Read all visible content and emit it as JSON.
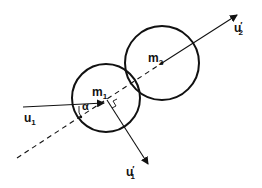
{
  "diagram": {
    "type": "elastic collision of two spheres",
    "bodies": [
      {
        "id": "m1",
        "label": "m",
        "subscript": "1",
        "center": [
          106,
          98
        ],
        "radius": 34
      },
      {
        "id": "m2",
        "label": "m",
        "subscript": "2",
        "center": [
          162,
          63
        ],
        "radius": 37
      }
    ],
    "vectors": [
      {
        "id": "u1",
        "label": "u",
        "subscript": "1",
        "prime": "",
        "from": [
          23,
          107
        ],
        "to": [
          103,
          103
        ]
      },
      {
        "id": "u1_prime",
        "label": "u",
        "subscript": "1",
        "prime": "′",
        "from": [
          106,
          99
        ],
        "to": [
          148,
          164
        ]
      },
      {
        "id": "u2_prime",
        "label": "u",
        "subscript": "2",
        "prime": "′",
        "from": [
          162,
          63
        ],
        "to": [
          237,
          15
        ]
      }
    ],
    "line_of_centers": {
      "style": "dashed",
      "from": [
        17,
        158
      ],
      "to": [
        162,
        63
      ]
    },
    "angle": {
      "label": "α"
    },
    "colors": {
      "stroke": "#111111",
      "background": "#ffffff"
    }
  }
}
